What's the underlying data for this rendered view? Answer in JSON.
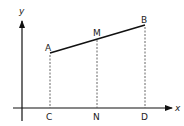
{
  "diagram": {
    "axes": {
      "x_label": "x",
      "y_label": "y"
    },
    "points": {
      "A": {
        "label": "A",
        "x": 50,
        "y": 53
      },
      "M": {
        "label": "M",
        "x": 97,
        "y": 38
      },
      "B": {
        "label": "B",
        "x": 145,
        "y": 25
      },
      "C": {
        "label": "C",
        "x": 50,
        "y": 108
      },
      "N": {
        "label": "N",
        "x": 97,
        "y": 108
      },
      "D": {
        "label": "D",
        "x": 145,
        "y": 108
      }
    },
    "segments": [
      {
        "from": "A",
        "to": "B",
        "style": "solid"
      },
      {
        "from": "A",
        "to": "C",
        "style": "dashed"
      },
      {
        "from": "M",
        "to": "N",
        "style": "dashed"
      },
      {
        "from": "B",
        "to": "D",
        "style": "dashed"
      }
    ],
    "colors": {
      "line": "#111111",
      "dashed": "#555555"
    }
  }
}
